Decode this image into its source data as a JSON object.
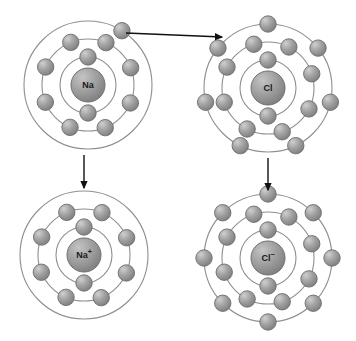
{
  "diagram": {
    "width": 356,
    "height": 341,
    "background_color": "#ffffff",
    "ring_color": "#8f8f8f",
    "electron_color": "#9a9a9a",
    "electron_highlight": "#c9c9c9",
    "nucleus_color": "#9a9a9a",
    "arrow_color": "#111111"
  },
  "atoms": [
    {
      "id": "sodium-atom",
      "name": "sodium-atom",
      "label": "Na",
      "charge": "",
      "cx": 88,
      "cy": 85,
      "shell_radii": [
        28,
        46,
        64
      ],
      "shell_counts": [
        2,
        8,
        1
      ],
      "electron_radius": 8.2,
      "nucleus_radius": 17,
      "label_font_size": 9,
      "shells": [
        {
          "index": 0,
          "radius": 28,
          "count": 2,
          "start_angle": -90
        },
        {
          "index": 1,
          "radius": 46,
          "count": 8,
          "start_angle": -112
        },
        {
          "index": 2,
          "radius": 64,
          "count": 1,
          "start_angle": -58
        }
      ]
    },
    {
      "id": "chlorine-atom",
      "name": "chlorine-atom",
      "label": "Cl",
      "charge": "",
      "cx": 268,
      "cy": 88,
      "shell_radii": [
        28,
        46,
        64
      ],
      "shell_counts": [
        2,
        8,
        7
      ],
      "electron_radius": 8.2,
      "nucleus_radius": 17,
      "label_font_size": 9,
      "shells": [
        {
          "index": 0,
          "radius": 28,
          "count": 2,
          "start_angle": -90
        },
        {
          "index": 1,
          "radius": 46,
          "count": 8,
          "start_angle": -108
        },
        {
          "index": 2,
          "radius": 64,
          "count": 7,
          "start_angle": -90
        }
      ]
    },
    {
      "id": "sodium-ion",
      "name": "sodium-ion",
      "label": "Na",
      "charge": "+",
      "cx": 84,
      "cy": 255,
      "shell_radii": [
        28,
        46,
        64
      ],
      "shell_counts": [
        2,
        8,
        0
      ],
      "electron_radius": 8.2,
      "nucleus_radius": 17,
      "label_font_size": 9,
      "shells": [
        {
          "index": 0,
          "radius": 28,
          "count": 2,
          "start_angle": -90
        },
        {
          "index": 1,
          "radius": 46,
          "count": 8,
          "start_angle": -112
        },
        {
          "index": 2,
          "radius": 64,
          "count": 0,
          "start_angle": -90
        }
      ]
    },
    {
      "id": "chloride-ion",
      "name": "chloride-ion",
      "label": "Cl",
      "charge": "−",
      "cx": 268,
      "cy": 258,
      "shell_radii": [
        28,
        46,
        64
      ],
      "shell_counts": [
        2,
        8,
        8
      ],
      "electron_radius": 8.2,
      "nucleus_radius": 17,
      "label_font_size": 9,
      "shells": [
        {
          "index": 0,
          "radius": 28,
          "count": 2,
          "start_angle": -90
        },
        {
          "index": 1,
          "radius": 46,
          "count": 8,
          "start_angle": -108
        },
        {
          "index": 2,
          "radius": 64,
          "count": 8,
          "start_angle": -90
        }
      ]
    }
  ],
  "arrows": [
    {
      "id": "electron-transfer-arrow",
      "name": "electron-transfer-arrow",
      "meaning": "electron transfer from sodium to chlorine",
      "x1": 126,
      "y1": 33,
      "x2": 222,
      "y2": 37
    },
    {
      "id": "sodium-to-ion-arrow",
      "name": "sodium-to-ion-arrow",
      "meaning": "sodium atom becomes sodium ion",
      "x1": 84,
      "y1": 155,
      "x2": 84,
      "y2": 188
    },
    {
      "id": "chlorine-to-ion-arrow",
      "name": "chlorine-to-ion-arrow",
      "meaning": "chlorine atom becomes chloride ion",
      "x1": 268,
      "y1": 158,
      "x2": 268,
      "y2": 190
    }
  ]
}
